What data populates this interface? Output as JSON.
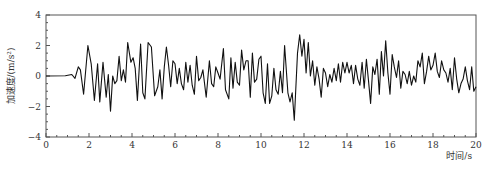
{
  "chart_data": {
    "type": "line",
    "title": "",
    "xlabel": "时间/s",
    "ylabel": "加速度/(m/s²)",
    "xlim": [
      0,
      20
    ],
    "ylim": [
      -4,
      4
    ],
    "xticks": [
      0,
      2,
      4,
      6,
      8,
      10,
      12,
      14,
      16,
      18,
      20
    ],
    "yticks": [
      -4,
      -2,
      0,
      2,
      4
    ],
    "grid": false,
    "legend": null,
    "series": [
      {
        "name": "acceleration",
        "color": "#111111",
        "points": [
          [
            0,
            0
          ],
          [
            0.9,
            0.02
          ],
          [
            1.2,
            0.1
          ],
          [
            1.35,
            -0.15
          ],
          [
            1.5,
            0.6
          ],
          [
            1.6,
            0.4
          ],
          [
            1.75,
            -1.2
          ],
          [
            1.95,
            2.0
          ],
          [
            2.1,
            0.8
          ],
          [
            2.25,
            -1.6
          ],
          [
            2.4,
            0.8
          ],
          [
            2.5,
            -1.7
          ],
          [
            2.65,
            0.9
          ],
          [
            2.8,
            -1.4
          ],
          [
            2.9,
            0.1
          ],
          [
            3.0,
            -2.3
          ],
          [
            3.1,
            0.0
          ],
          [
            3.2,
            -0.5
          ],
          [
            3.3,
            -0.3
          ],
          [
            3.4,
            1.3
          ],
          [
            3.5,
            -0.3
          ],
          [
            3.6,
            0.4
          ],
          [
            3.7,
            -0.4
          ],
          [
            3.8,
            2.2
          ],
          [
            3.95,
            0.9
          ],
          [
            4.05,
            1.2
          ],
          [
            4.15,
            0.5
          ],
          [
            4.25,
            -1.6
          ],
          [
            4.4,
            2.1
          ],
          [
            4.5,
            -1.1
          ],
          [
            4.6,
            -1.5
          ],
          [
            4.75,
            2.2
          ],
          [
            4.9,
            1.9
          ],
          [
            5.05,
            -1.3
          ],
          [
            5.2,
            -0.7
          ],
          [
            5.3,
            0.4
          ],
          [
            5.4,
            -1.5
          ],
          [
            5.5,
            0.6
          ],
          [
            5.6,
            1.9
          ],
          [
            5.7,
            0.7
          ],
          [
            5.8,
            -0.7
          ],
          [
            5.9,
            1.0
          ],
          [
            6.0,
            0.8
          ],
          [
            6.1,
            -0.5
          ],
          [
            6.2,
            0.5
          ],
          [
            6.3,
            -0.5
          ],
          [
            6.4,
            -0.9
          ],
          [
            6.5,
            0.9
          ],
          [
            6.6,
            -0.4
          ],
          [
            6.7,
            0.7
          ],
          [
            6.8,
            -0.6
          ],
          [
            6.9,
            -1.2
          ],
          [
            7.0,
            1.3
          ],
          [
            7.1,
            -0.3
          ],
          [
            7.2,
            -0.1
          ],
          [
            7.3,
            0.4
          ],
          [
            7.45,
            -1.4
          ],
          [
            7.6,
            1.0
          ],
          [
            7.7,
            -0.5
          ],
          [
            7.8,
            -0.7
          ],
          [
            7.9,
            0.6
          ],
          [
            8.0,
            0.2
          ],
          [
            8.1,
            -0.2
          ],
          [
            8.25,
            1.8
          ],
          [
            8.35,
            -0.9
          ],
          [
            8.5,
            -1.5
          ],
          [
            8.6,
            1.2
          ],
          [
            8.7,
            -0.8
          ],
          [
            8.8,
            0.9
          ],
          [
            8.9,
            -0.4
          ],
          [
            9.0,
            -0.6
          ],
          [
            9.1,
            1.7
          ],
          [
            9.2,
            0.4
          ],
          [
            9.3,
            1.0
          ],
          [
            9.4,
            1.0
          ],
          [
            9.5,
            -1.4
          ],
          [
            9.6,
            1.5
          ],
          [
            9.7,
            -0.4
          ],
          [
            9.8,
            -0.2
          ],
          [
            9.9,
            1.1
          ],
          [
            10.0,
            1.3
          ],
          [
            10.1,
            -1.1
          ],
          [
            10.2,
            -1.8
          ],
          [
            10.3,
            0.8
          ],
          [
            10.4,
            -1.8
          ],
          [
            10.5,
            -1.3
          ],
          [
            10.6,
            0.5
          ],
          [
            10.7,
            -0.9
          ],
          [
            10.8,
            -1.2
          ],
          [
            10.9,
            0.3
          ],
          [
            11.0,
            -1.1
          ],
          [
            11.1,
            2.0
          ],
          [
            11.25,
            -1.1
          ],
          [
            11.35,
            -1.7
          ],
          [
            11.45,
            -1.1
          ],
          [
            11.55,
            -2.9
          ],
          [
            11.7,
            1.5
          ],
          [
            11.8,
            2.7
          ],
          [
            11.9,
            1.3
          ],
          [
            12.0,
            2.4
          ],
          [
            12.1,
            0.2
          ],
          [
            12.2,
            2.2
          ],
          [
            12.3,
            0.0
          ],
          [
            12.4,
            1.0
          ],
          [
            12.5,
            -0.6
          ],
          [
            12.6,
            0.6
          ],
          [
            12.7,
            -0.2
          ],
          [
            12.8,
            -1.4
          ],
          [
            12.9,
            0.5
          ],
          [
            13.0,
            0.2
          ],
          [
            13.1,
            -0.7
          ],
          [
            13.2,
            0.1
          ],
          [
            13.3,
            -0.4
          ],
          [
            13.4,
            0.5
          ],
          [
            13.5,
            -0.3
          ],
          [
            13.6,
            0.8
          ],
          [
            13.7,
            -0.4
          ],
          [
            13.8,
            0.9
          ],
          [
            13.9,
            0.2
          ],
          [
            14.0,
            0.9
          ],
          [
            14.1,
            0.2
          ],
          [
            14.2,
            0.7
          ],
          [
            14.3,
            -0.5
          ],
          [
            14.4,
            0.7
          ],
          [
            14.5,
            -0.2
          ],
          [
            14.6,
            -0.6
          ],
          [
            14.7,
            0.9
          ],
          [
            14.8,
            -0.8
          ],
          [
            14.9,
            1.1
          ],
          [
            15.0,
            -0.3
          ],
          [
            15.1,
            -1.8
          ],
          [
            15.2,
            0.6
          ],
          [
            15.3,
            0.1
          ],
          [
            15.4,
            1.1
          ],
          [
            15.5,
            -1.2
          ],
          [
            15.6,
            1.6
          ],
          [
            15.7,
            0.0
          ],
          [
            15.8,
            2.3
          ],
          [
            15.9,
            0.2
          ],
          [
            16.0,
            -1.2
          ],
          [
            16.1,
            1.4
          ],
          [
            16.2,
            0.6
          ],
          [
            16.3,
            -0.1
          ],
          [
            16.4,
            1.0
          ],
          [
            16.5,
            -0.8
          ],
          [
            16.6,
            0.3
          ],
          [
            16.7,
            0.1
          ],
          [
            16.8,
            -0.5
          ],
          [
            16.9,
            0.3
          ],
          [
            17.0,
            -0.6
          ],
          [
            17.1,
            0.0
          ],
          [
            17.2,
            -0.4
          ],
          [
            17.3,
            1.0
          ],
          [
            17.4,
            0.6
          ],
          [
            17.5,
            1.5
          ],
          [
            17.6,
            -0.5
          ],
          [
            17.7,
            0.3
          ],
          [
            17.8,
            1.3
          ],
          [
            17.9,
            0.4
          ],
          [
            18.0,
            0.7
          ],
          [
            18.1,
            1.5
          ],
          [
            18.2,
            0.3
          ],
          [
            18.3,
            -0.1
          ],
          [
            18.4,
            1.0
          ],
          [
            18.5,
            0.4
          ],
          [
            18.6,
            0.2
          ],
          [
            18.7,
            -0.4
          ],
          [
            18.8,
            0.5
          ],
          [
            18.9,
            -0.9
          ],
          [
            19.0,
            1.2
          ],
          [
            19.1,
            -0.2
          ],
          [
            19.2,
            -1.1
          ],
          [
            19.3,
            -0.5
          ],
          [
            19.4,
            -0.2
          ],
          [
            19.5,
            0.6
          ],
          [
            19.6,
            -0.3
          ],
          [
            19.7,
            -0.9
          ],
          [
            19.8,
            0.6
          ],
          [
            19.9,
            -1.0
          ],
          [
            20.0,
            -0.7
          ]
        ]
      }
    ]
  }
}
